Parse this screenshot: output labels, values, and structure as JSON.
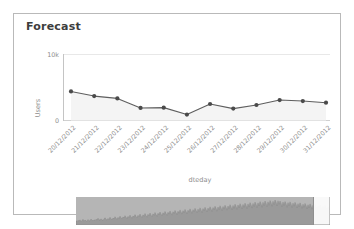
{
  "card": {
    "title": "Forecast"
  },
  "chart_data": {
    "type": "line",
    "title": "Forecast",
    "xlabel": "dteday",
    "ylabel": "Users",
    "ylim": [
      0,
      10000
    ],
    "yticks": [
      0,
      10000
    ],
    "ytick_labels": [
      "0",
      "10k"
    ],
    "grid": true,
    "legend": "none",
    "area_fill": true,
    "marker": "circle",
    "line_color": "#5a5a5a",
    "marker_color": "#4a4a4a",
    "area_color": "#f2f2f2",
    "grid_color": "#e8e8e8",
    "categories": [
      "20/12/2012",
      "21/12/2012",
      "22/12/2012",
      "23/12/2012",
      "24/12/2012",
      "25/12/2012",
      "26/12/2012",
      "27/12/2012",
      "28/12/2012",
      "29/12/2012",
      "30/12/2012",
      "31/12/2012"
    ],
    "values": [
      4400,
      3700,
      3350,
      1900,
      1950,
      900,
      2500,
      1800,
      2350,
      3100,
      2950,
      2700
    ],
    "series": [
      {
        "name": "Users",
        "values": [
          4400,
          3700,
          3350,
          1900,
          1950,
          900,
          2500,
          1800,
          2350,
          3100,
          2950,
          2700
        ]
      }
    ]
  },
  "range_selector": {
    "name": "range-selector",
    "overview_color": "#b5b5b5",
    "selection_color": "#ffffff",
    "selection_border": "#8f8f8f",
    "selection_start_pct": 93.5,
    "selection_end_pct": 100,
    "overview_values": [
      12,
      10,
      14,
      11,
      16,
      9,
      13,
      18,
      11,
      15,
      12,
      10,
      17,
      13,
      11,
      19,
      14,
      12,
      16,
      13,
      18,
      15,
      22,
      17,
      14,
      20,
      16,
      13,
      19,
      24,
      18,
      15,
      21,
      17,
      26,
      20,
      16,
      23,
      19,
      28,
      22,
      18,
      25,
      21,
      30,
      24,
      20,
      27,
      23,
      32,
      26,
      21,
      29,
      25,
      34,
      27,
      22,
      31,
      26,
      36,
      29,
      24,
      33,
      28,
      38,
      30,
      25,
      35,
      29,
      40,
      32,
      26,
      37,
      31,
      42,
      34,
      28,
      39,
      33,
      44,
      36,
      29,
      41,
      35,
      46,
      38,
      31,
      43,
      36,
      48,
      40,
      33,
      45,
      38,
      50,
      42,
      34,
      47,
      40,
      52,
      44,
      36,
      49,
      41,
      54,
      46,
      38,
      51,
      43,
      56,
      48,
      39,
      53,
      45,
      58,
      50,
      41,
      55,
      47,
      60,
      52,
      43,
      57,
      48,
      62,
      54,
      44,
      59,
      50,
      64,
      56,
      46,
      61,
      52,
      66,
      58,
      48,
      63,
      54,
      68,
      60,
      49,
      65,
      55,
      70,
      62,
      51,
      67,
      57,
      72,
      64,
      53,
      69,
      59,
      74,
      66,
      54,
      71,
      60,
      76,
      68,
      56,
      73,
      62,
      78,
      70,
      58,
      75,
      64,
      80,
      72,
      59,
      77,
      65,
      82,
      74,
      61,
      79,
      67,
      84,
      76,
      63,
      81,
      69,
      86,
      78,
      64,
      83,
      70,
      88,
      80,
      66,
      85,
      72,
      90,
      82,
      68,
      87,
      74,
      92,
      84,
      69,
      89,
      75,
      88,
      80,
      66,
      84,
      71,
      86,
      78,
      64,
      82,
      70,
      85,
      77,
      63,
      80,
      68,
      83,
      75,
      62,
      78,
      66,
      81,
      73,
      60,
      76,
      64,
      79,
      71,
      58,
      74,
      62,
      77,
      69,
      57,
      72,
      61,
      75,
      67,
      55,
      70,
      59,
      73,
      65,
      54,
      68,
      57,
      71,
      63,
      52,
      66,
      56,
      69
    ]
  }
}
